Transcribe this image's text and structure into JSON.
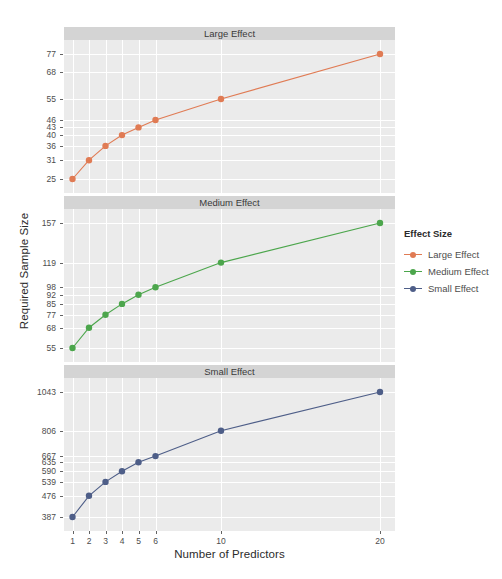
{
  "chart_data": {
    "type": "line",
    "title": "",
    "xlabel": "Number of Predictors",
    "ylabel": "Required Sample Size",
    "x": [
      1,
      2,
      3,
      4,
      5,
      6,
      10,
      20
    ],
    "xtick_labels": [
      "1",
      "2",
      "3",
      "4",
      "5",
      "6",
      "10",
      "20"
    ],
    "grid": true,
    "legend_position": "right",
    "legend_title": "Effect Size",
    "facet_layout": "vertical-3",
    "series": [
      {
        "name": "Large Effect",
        "panel": "Large Effect",
        "color": "#E07B54",
        "values": [
          25,
          31,
          36,
          40,
          43,
          46,
          55,
          77
        ],
        "ytick_labels": [
          "77",
          "68",
          "55",
          "46",
          "43",
          "40",
          "36",
          "31",
          "25"
        ],
        "ytick_values": [
          77,
          68,
          55,
          46,
          43,
          40,
          36,
          31,
          25
        ]
      },
      {
        "name": "Medium Effect",
        "panel": "Medium Effect",
        "color": "#4CA64C",
        "values": [
          55,
          68,
          77,
          85,
          92,
          98,
          119,
          157
        ],
        "ytick_labels": [
          "157",
          "119",
          "98",
          "92",
          "85",
          "77",
          "68",
          "55"
        ],
        "ytick_values": [
          157,
          119,
          98,
          92,
          85,
          77,
          68,
          55
        ]
      },
      {
        "name": "Small Effect",
        "panel": "Small Effect",
        "color": "#4E5E88",
        "values": [
          387,
          476,
          539,
          590,
          635,
          667,
          806,
          1043
        ],
        "ytick_labels": [
          "1043",
          "806",
          "667",
          "635",
          "590",
          "539",
          "476",
          "387"
        ],
        "ytick_values": [
          1043,
          806,
          667,
          635,
          590,
          539,
          476,
          387
        ]
      }
    ]
  },
  "axes": {
    "y_title": "Required Sample Size",
    "x_title": "Number of Predictors"
  },
  "panels": [
    {
      "strip_label": "Large Effect"
    },
    {
      "strip_label": "Medium Effect"
    },
    {
      "strip_label": "Small Effect"
    }
  ],
  "legend": {
    "title": "Effect Size",
    "items": [
      {
        "label": "Large Effect",
        "color": "#E07B54"
      },
      {
        "label": "Medium Effect",
        "color": "#4CA64C"
      },
      {
        "label": "Small Effect",
        "color": "#4E5E88"
      }
    ]
  }
}
